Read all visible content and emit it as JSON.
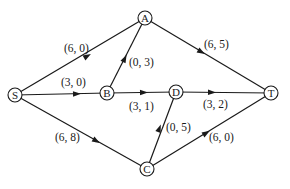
{
  "diagram": {
    "type": "directed-flow-network",
    "nodes": [
      {
        "id": "S",
        "label": "S",
        "x": 15,
        "y": 95
      },
      {
        "id": "A",
        "label": "A",
        "x": 145,
        "y": 18
      },
      {
        "id": "B",
        "label": "B",
        "x": 107,
        "y": 93
      },
      {
        "id": "D",
        "label": "D",
        "x": 176,
        "y": 92
      },
      {
        "id": "T",
        "label": "T",
        "x": 271,
        "y": 93
      },
      {
        "id": "C",
        "label": "C",
        "x": 147,
        "y": 169
      }
    ],
    "edges": [
      {
        "from": "S",
        "to": "A",
        "label": "(6, 0)"
      },
      {
        "from": "S",
        "to": "B",
        "label": "(3, 0)"
      },
      {
        "from": "S",
        "to": "C",
        "label": "(6, 8)"
      },
      {
        "from": "B",
        "to": "A",
        "label": "(0, 3)"
      },
      {
        "from": "B",
        "to": "D",
        "label": "(3, 1)"
      },
      {
        "from": "A",
        "to": "T",
        "label": "(6, 5)"
      },
      {
        "from": "D",
        "to": "T",
        "label": "(3, 2)"
      },
      {
        "from": "C",
        "to": "D",
        "label": "(0, 5)"
      },
      {
        "from": "C",
        "to": "T",
        "label": "(6, 0)"
      }
    ]
  }
}
